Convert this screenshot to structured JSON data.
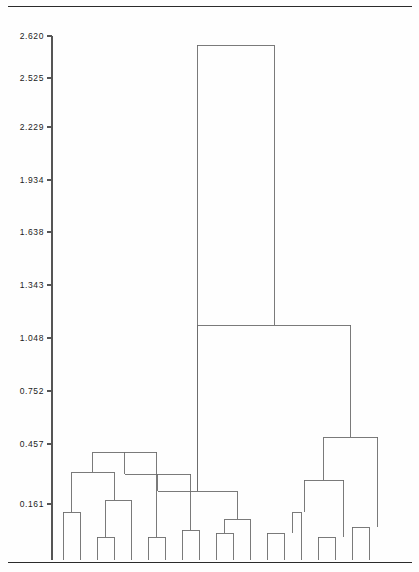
{
  "figure": {
    "kind": "dendrogram",
    "background_color": "#fefefe",
    "line_color": "#6b6b6b",
    "rule_color": "#2b2b2b",
    "axis_color": "#555555"
  },
  "chart_data": {
    "type": "line",
    "subtype": "dendrogram",
    "title": "",
    "xlabel": "",
    "ylabel": "",
    "grid": false,
    "legend": false,
    "orientation": "vertical",
    "n_leaves": 24,
    "ylim": [
      0.0,
      2.62
    ],
    "axis_tick_labels": [
      "2.620",
      "2.525",
      "2.229",
      "1.934",
      "1.638",
      "1.343",
      "1.048",
      "0.752",
      "0.457",
      "0.161"
    ],
    "axis_tick_values": [
      2.62,
      2.525,
      2.229,
      1.934,
      1.638,
      1.343,
      1.048,
      0.752,
      0.457,
      0.161
    ],
    "axis_tick_pixel_y": [
      36,
      78,
      127,
      180,
      232,
      285,
      338,
      391,
      444,
      504
    ],
    "leaf_pixel_x": [
      63,
      80,
      97,
      114,
      131,
      148,
      165,
      182,
      199,
      216,
      233,
      250,
      267,
      284,
      301,
      318,
      335,
      352,
      369,
      386,
      403,
      420,
      437,
      454
    ],
    "baseline_pixel_y": 560,
    "merges": [
      {
        "id": "m1",
        "left": "leaf0",
        "right": "leaf1",
        "height_px": 512,
        "x_px": 71.5
      },
      {
        "id": "m2",
        "left": "leaf2",
        "right": "leaf3",
        "height_px": 537,
        "x_px": 105.5
      },
      {
        "id": "m3",
        "left": "m2",
        "right": "leaf4",
        "height_px": 500,
        "x_px": 114.0
      },
      {
        "id": "m4",
        "left": "m1",
        "right": "m3",
        "height_px": 472,
        "x_px": 92.8
      },
      {
        "id": "m5",
        "left": "leaf5",
        "right": "leaf6",
        "height_px": 537,
        "x_px": 156.5
      },
      {
        "id": "m6",
        "left": "m4",
        "right": "m5",
        "height_px": 452,
        "x_px": 124.6
      },
      {
        "id": "m7",
        "left": "leaf7",
        "right": "leaf8",
        "height_px": 530,
        "x_px": 190.5
      },
      {
        "id": "m8",
        "left": "m6",
        "right": "m7",
        "height_px": 474,
        "x_px": 157.6
      },
      {
        "id": "m9",
        "left": "leaf9",
        "right": "leaf10",
        "height_px": 533,
        "x_px": 224.5
      },
      {
        "id": "m10",
        "left": "leaf11",
        "right": "m9",
        "height_px": 519,
        "x_px": 237.2
      },
      {
        "id": "m11",
        "left": "m8",
        "right": "m10",
        "height_px": 491,
        "x_px": 197.4
      },
      {
        "id": "m12",
        "left": "leaf12",
        "right": "leaf13",
        "height_px": 533,
        "x_px": 292.5
      },
      {
        "id": "m13",
        "left": "m12",
        "right": "leaf14",
        "height_px": 512,
        "x_px": 304.0
      },
      {
        "id": "m14",
        "left": "leaf15",
        "right": "leaf16",
        "height_px": 537,
        "x_px": 343.5
      },
      {
        "id": "m15",
        "left": "m13",
        "right": "m14",
        "height_px": 480,
        "x_px": 323.8
      },
      {
        "id": "m16",
        "left": "leaf17",
        "right": "leaf18",
        "height_px": 527,
        "x_px": 377.5
      },
      {
        "id": "m17",
        "left": "m15",
        "right": "m16",
        "height_px": 437,
        "x_px": 350.6
      },
      {
        "id": "m18",
        "left": "m11",
        "right": "m17",
        "height_px": 325,
        "x_px": 274.0
      },
      {
        "id": "m19",
        "left": "m_left_big",
        "right": "m18",
        "height_px": 45,
        "x_px": 234.5
      }
    ]
  },
  "axis": {
    "tick_mark_length": 5,
    "spine_x": 52
  }
}
